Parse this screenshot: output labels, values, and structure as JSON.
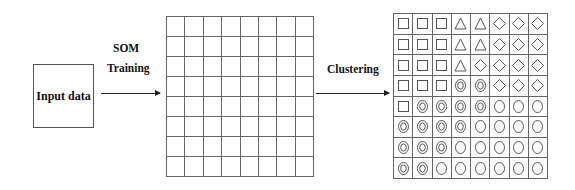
{
  "input_box": {
    "label": "Input data"
  },
  "arrow_training": {
    "label_line1": "SOM",
    "label_line2": "Training"
  },
  "arrow_clustering": {
    "label": "Clustering"
  },
  "som_grid": {
    "rows": 8,
    "cols": 8
  },
  "cluster_grid": {
    "rows": 8,
    "cols": 8,
    "legend_shapes": [
      "square",
      "triangle",
      "diamond",
      "double-circle",
      "circle"
    ],
    "cells": [
      [
        "square",
        "square",
        "square",
        "triangle",
        "triangle",
        "diamond",
        "diamond",
        "diamond"
      ],
      [
        "square",
        "square",
        "square",
        "triangle",
        "triangle",
        "diamond",
        "diamond",
        "diamond"
      ],
      [
        "square",
        "square",
        "square",
        "triangle",
        "diamond",
        "diamond",
        "diamond",
        "diamond"
      ],
      [
        "square",
        "square",
        "square",
        "double-circle",
        "double-circle",
        "diamond",
        "diamond",
        "diamond"
      ],
      [
        "square",
        "double-circle",
        "double-circle",
        "double-circle",
        "double-circle",
        "circle",
        "circle",
        "circle"
      ],
      [
        "double-circle",
        "double-circle",
        "double-circle",
        "double-circle",
        "circle",
        "circle",
        "circle",
        "circle"
      ],
      [
        "double-circle",
        "double-circle",
        "double-circle",
        "circle",
        "circle",
        "circle",
        "circle",
        "circle"
      ],
      [
        "double-circle",
        "double-circle",
        "circle",
        "circle",
        "circle",
        "circle",
        "circle",
        "circle"
      ]
    ]
  }
}
